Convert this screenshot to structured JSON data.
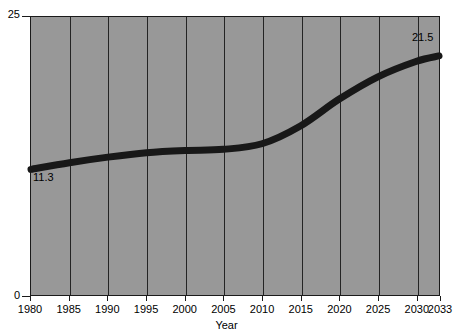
{
  "chart_data": {
    "type": "line",
    "title": "",
    "xlabel": "Year",
    "ylabel": "",
    "xlim": [
      1980,
      2033
    ],
    "ylim": [
      0,
      25
    ],
    "grid": true,
    "legend": "none",
    "x_ticks": [
      "1980",
      "1985",
      "1990",
      "1995",
      "2000",
      "2005",
      "2010",
      "2015",
      "2020",
      "2025",
      "2030",
      "2033"
    ],
    "y_ticks": [
      "0",
      "25"
    ],
    "series": [
      {
        "name": "value",
        "x": [
          1980,
          1985,
          1990,
          1995,
          2000,
          2005,
          2010,
          2015,
          2020,
          2025,
          2030,
          2033
        ],
        "values": [
          11.3,
          11.9,
          12.4,
          12.8,
          13.0,
          13.1,
          13.6,
          15.2,
          17.6,
          19.6,
          21.0,
          21.5
        ]
      }
    ],
    "annotations": [
      {
        "text": "11.3",
        "x": 1980,
        "y": 11.3,
        "position": "below-right"
      },
      {
        "text": "21.5",
        "x": 2033,
        "y": 21.5,
        "position": "above-left"
      }
    ],
    "colors": {
      "plot_background": "#989898",
      "line": "#181818",
      "grid": "#242424",
      "axis": "#1a1a1a",
      "text": "#000000",
      "page_background": "#ffffff"
    }
  },
  "axis": {
    "y_top_label": "25",
    "y_bottom_label": "0",
    "x_title": "Year"
  },
  "annotations": {
    "start_value": "11.3",
    "end_value": "21.5"
  }
}
